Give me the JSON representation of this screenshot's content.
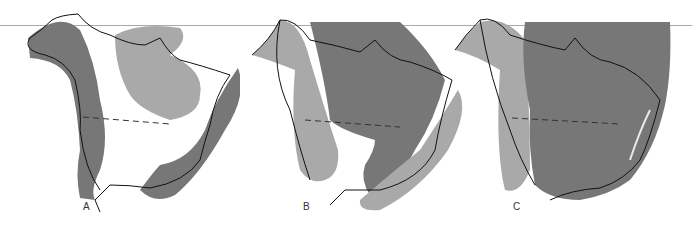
{
  "figure": {
    "colors": {
      "dark_region": "#777777",
      "light_region": "#a9a9a9",
      "outline": "#111111",
      "background": "#ffffff"
    },
    "panels": [
      {
        "label": "A",
        "regions": [
          "western-dark-band",
          "northeast-light-region",
          "eastern-dark-band"
        ]
      },
      {
        "label": "B",
        "regions": [
          "western-light-region",
          "central-dark-region",
          "eastern-light-band"
        ]
      },
      {
        "label": "C",
        "regions": [
          "western-light-strip",
          "central-eastern-dark-region"
        ]
      }
    ]
  }
}
